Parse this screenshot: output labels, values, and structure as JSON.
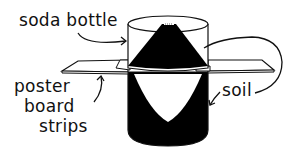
{
  "diagram": {
    "labels": {
      "soda_bottle": "soda bottle",
      "poster_board": [
        "poster",
        "board",
        "strips"
      ],
      "soil": "soil"
    },
    "colors": {
      "ink": "#111111",
      "fill": "#000000",
      "background": "#ffffff",
      "board": "#ffffff"
    }
  }
}
